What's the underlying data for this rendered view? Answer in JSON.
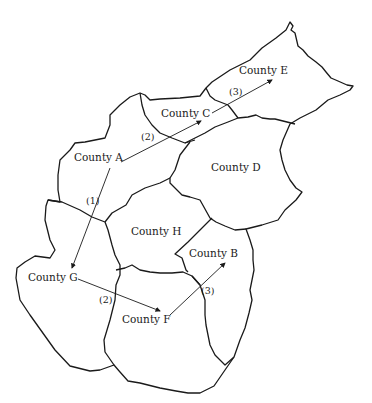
{
  "map": {
    "counties": [
      {
        "id": "A",
        "label": "County A",
        "x": 74,
        "y": 158
      },
      {
        "id": "B",
        "label": "County B",
        "x": 189,
        "y": 247
      },
      {
        "id": "C",
        "label": "County C",
        "x": 161,
        "y": 107
      },
      {
        "id": "D",
        "label": "County D",
        "x": 211,
        "y": 161
      },
      {
        "id": "E",
        "label": "County E",
        "x": 239,
        "y": 64
      },
      {
        "id": "F",
        "label": "County F",
        "x": 122,
        "y": 313
      },
      {
        "id": "G",
        "label": "County G",
        "x": 28,
        "y": 271
      },
      {
        "id": "H",
        "label": "County H",
        "x": 131,
        "y": 225
      }
    ],
    "routes": [
      {
        "from": "County A",
        "to": "County G",
        "step": "(1)"
      },
      {
        "from": "County A",
        "to": "County C",
        "step": "(2)"
      },
      {
        "from": "County C",
        "to": "County E",
        "step": "(3)"
      },
      {
        "from": "County G",
        "to": "County F",
        "step": "(2)"
      },
      {
        "from": "County F",
        "to": "County B",
        "step": "(3)"
      }
    ],
    "step_labels": [
      {
        "text": "(1)",
        "x": 86,
        "y": 195
      },
      {
        "text": "(2)",
        "x": 141,
        "y": 131
      },
      {
        "text": "(3)",
        "x": 229,
        "y": 86
      },
      {
        "text": "(2)",
        "x": 99,
        "y": 294
      },
      {
        "text": "(3)",
        "x": 201,
        "y": 285
      }
    ]
  }
}
